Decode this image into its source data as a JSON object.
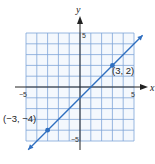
{
  "chart_data": {
    "type": "line",
    "title": "",
    "xlabel": "x",
    "ylabel": "y",
    "xlim": [
      -5,
      5
    ],
    "ylim": [
      -5,
      5
    ],
    "grid": true,
    "x_ticks": [
      "-5",
      "5"
    ],
    "y_ticks": [
      "5",
      "-5"
    ],
    "series": [
      {
        "name": "line through (-3,-4) and (3,2)",
        "equation": "y = x - 1",
        "x": [
          -4.8,
          5.8
        ],
        "y": [
          -5.8,
          4.8
        ],
        "color": "#2f6fc0"
      }
    ],
    "points": [
      {
        "x": -3,
        "y": -4,
        "label": "(−3, −4)"
      },
      {
        "x": 3,
        "y": 2,
        "label": "(3, 2)"
      }
    ],
    "colors": {
      "grid": "#7fa4d8",
      "line": "#2f6fc0",
      "axis": "#222222"
    }
  },
  "labels": {
    "x_axis": "x",
    "y_axis": "y",
    "x_min": "−5",
    "x_max": "5",
    "y_max": "5",
    "y_min": "−5",
    "point_a": "(−3, −4)",
    "point_b": "(3, 2)"
  }
}
